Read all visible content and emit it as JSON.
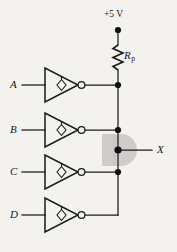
{
  "figure": {
    "type": "logic-circuit-schematic",
    "background_color": "#f4f2ef",
    "ink_color": "#1a1a1a"
  },
  "supply": {
    "label": "+5 V",
    "terminal": "supply-terminal-dot"
  },
  "resistor": {
    "label_main": "R",
    "label_sub": "p",
    "symbol": "zigzag-resistor"
  },
  "inputs": [
    {
      "label": "A"
    },
    {
      "label": "B"
    },
    {
      "label": "C"
    },
    {
      "label": "D"
    }
  ],
  "output": {
    "label": "X"
  },
  "gates": {
    "count": 4,
    "type": "inverter",
    "inner_marker": "open-collector-diamond",
    "output_marker": "inversion-bubble"
  },
  "nodes": {
    "junction_count": 4,
    "wired_and_bus": "vertical-output-bus"
  },
  "watermark": {
    "shape": "rounded-block"
  }
}
